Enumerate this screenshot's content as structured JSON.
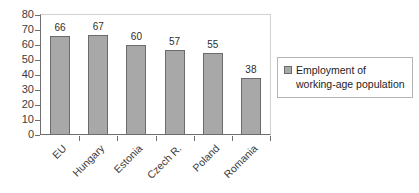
{
  "chart_data": {
    "type": "bar",
    "title": "",
    "xlabel": "",
    "ylabel": "",
    "categories": [
      "EU",
      "Hungary",
      "Estonia",
      "Czech R.",
      "Poland",
      "Romania"
    ],
    "values": [
      66,
      67,
      60,
      57,
      55,
      38
    ],
    "series": [
      {
        "name": "Employment of working-age population",
        "values": [
          66,
          67,
          60,
          57,
          55,
          38
        ]
      }
    ],
    "ylim": [
      0,
      80
    ],
    "ytick_step": 10,
    "yticks": [
      "80",
      "70",
      "60",
      "50",
      "40",
      "30",
      "20",
      "10",
      "0"
    ],
    "grid": false,
    "legend_position": "right",
    "bar_color": "#a8a8a8",
    "bar_border_color": "#6b6b6b",
    "axis_color": "#6e6e6e",
    "text_color": "#3c3c3c",
    "background_color": "#ffffff"
  },
  "legend": {
    "entries": [
      {
        "label_line1": "Employment of",
        "label_line2": "working-age population",
        "swatch_color": "#a8a8a8"
      }
    ]
  }
}
